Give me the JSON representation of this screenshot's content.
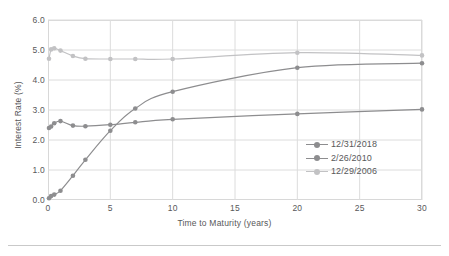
{
  "chart_data": {
    "type": "line",
    "title": "",
    "xlabel": "Time to Maturity (years)",
    "ylabel": "Interest Rate (%)",
    "xlim": [
      0,
      30
    ],
    "ylim": [
      0,
      6
    ],
    "xticks": [
      "0",
      "5",
      "10",
      "15",
      "20",
      "25",
      "30"
    ],
    "xtick_values": [
      0,
      5,
      10,
      15,
      20,
      25,
      30
    ],
    "yticks": [
      "0.0",
      "1.0",
      "2.0",
      "3.0",
      "4.0",
      "5.0",
      "6.0"
    ],
    "ytick_values": [
      0,
      1,
      2,
      3,
      4,
      5,
      6
    ],
    "grid": true,
    "legend_position": "inside lower-right",
    "series": [
      {
        "name": "12/31/2018",
        "color": "#8d8d8f",
        "x": [
          0.08,
          0.25,
          0.5,
          1,
          2,
          3,
          5,
          7,
          10,
          20,
          30
        ],
        "values": [
          2.4,
          2.45,
          2.56,
          2.63,
          2.48,
          2.46,
          2.51,
          2.59,
          2.69,
          2.87,
          3.02
        ]
      },
      {
        "name": "2/26/2010",
        "color": "#8d8d8f",
        "x": [
          0.08,
          0.25,
          0.5,
          1,
          2,
          3,
          5,
          7,
          10,
          20,
          30
        ],
        "values": [
          0.06,
          0.13,
          0.18,
          0.31,
          0.81,
          1.34,
          2.31,
          3.05,
          3.61,
          4.41,
          4.56
        ]
      },
      {
        "name": "12/29/2006",
        "color": "#c2c2c4",
        "x": [
          0.08,
          0.25,
          0.5,
          1,
          2,
          3,
          5,
          7,
          10,
          20,
          30
        ],
        "values": [
          4.71,
          5.02,
          5.06,
          4.98,
          4.8,
          4.71,
          4.7,
          4.7,
          4.7,
          4.91,
          4.82
        ]
      }
    ]
  },
  "legend": {
    "items": [
      {
        "label": "12/31/2018"
      },
      {
        "label": "2/26/2010"
      },
      {
        "label": "12/29/2006"
      }
    ]
  },
  "axes": {
    "x_title": "Time to Maturity (years)",
    "y_title": "Interest Rate (%)"
  },
  "colors": {
    "series_dark": "#8d8d8f",
    "series_light": "#c2c2c4",
    "grid": "#dcdcdc",
    "frame": "#d8d8d8",
    "text": "#58585a",
    "rule": "#c9c9c9"
  }
}
